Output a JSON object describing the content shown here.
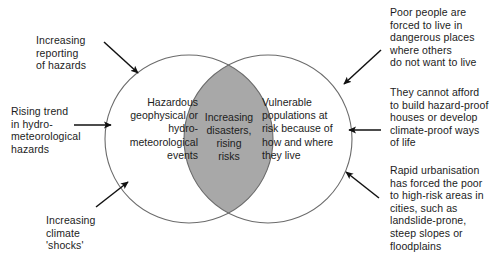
{
  "figure": {
    "kind": "venn-diagram",
    "colors": {
      "overlap_fill": "#a8a8a8",
      "circle_stroke": "#6b6b6b",
      "circle_fill": "#ffffff",
      "arrow": "#111111",
      "text": "#1c1c1c",
      "background": "#ffffff"
    },
    "circles": {
      "left": {
        "cx": 189,
        "cy": 139,
        "r": 84
      },
      "right": {
        "cx": 268,
        "cy": 139,
        "r": 84
      }
    }
  },
  "sets": {
    "left_label": "Hazardous\ngeophysical or\nhydro-\nmeteorological\nevents",
    "right_label": "Vulnerable\npopulations at\nrisk because of\nhow and where\nthey live",
    "overlap_label": "Increasing\ndisasters,\nrising\nrisks"
  },
  "annotations": {
    "top_left": "Increasing\nreporting\nof hazards",
    "mid_left": "Rising trend\nin hydro-\nmeteorological\nhazards",
    "bottom_left": "Increasing\nclimate\n'shocks'",
    "top_right": "Poor people are\nforced to live in\ndangerous places\nwhere others\ndo not want to live",
    "mid_right": "They cannot afford\nto build hazard-proof\nhouses or develop\nclimate-proof ways\nof life",
    "bottom_right": "Rapid urbanisation\nhas forced the poor\nto high-risk areas in\ncities, such as\nlandslide-prone,\nsteep slopes or\nfloodplains"
  },
  "caption": {
    "text": ""
  }
}
